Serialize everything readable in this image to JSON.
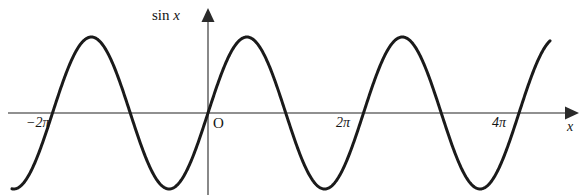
{
  "figure": {
    "background_color": "#ffffff",
    "width": 586,
    "height": 195
  },
  "labels": {
    "y_axis_label_prefix": "sin",
    "y_axis_label_variable": "x",
    "origin": "O",
    "x_axis_variable": "x",
    "tick_neg_2pi": "−2π",
    "tick_2pi": "2π",
    "tick_4pi": "4π"
  },
  "chart_data": {
    "type": "line",
    "title": "",
    "subtitle": "",
    "xlabel": "x",
    "ylabel": "sin x",
    "function": "y = sin x",
    "grid": false,
    "legend": null,
    "curve_color": "#1a1a1a",
    "curve_width_px": 3,
    "axis_color": "#6b6b6b",
    "axis_width_px": 1.5,
    "xlim_radians": [
      -7.22,
      14.05
    ],
    "ylim": [
      -1.08,
      1.08
    ],
    "period_radians": 6.283185307179586,
    "amplitude": 1,
    "x_tick_labels": [
      "−2π",
      "2π",
      "4π"
    ],
    "x_tick_values_radians": [
      -6.283185307,
      6.283185307,
      12.56637061
    ],
    "y_tick_labels": [],
    "y_tick_values": [],
    "zero_crossings_radians": [
      -6.283185307,
      -3.141592654,
      0,
      3.141592654,
      6.283185307,
      9.424777961,
      12.56637061
    ],
    "maxima_radians": [
      -4.71238898,
      1.570796327,
      7.853981634,
      14.13716694
    ],
    "minima_radians": [
      -1.570796327,
      4.71238898,
      10.99557429
    ],
    "maxima_value": 1,
    "minima_value": -1,
    "x": [
      -7.22,
      -7.0,
      -6.75,
      -6.5,
      -6.283185307,
      -6.0,
      -5.75,
      -5.5,
      -5.25,
      -5.0,
      -4.71238898,
      -4.5,
      -4.25,
      -4.0,
      -3.75,
      -3.5,
      -3.141592654,
      -2.9,
      -2.65,
      -2.4,
      -2.1,
      -1.8,
      -1.570796327,
      -1.3,
      -1.0,
      -0.7,
      -0.35,
      0,
      0.35,
      0.7,
      1.0,
      1.3,
      1.570796327,
      1.85,
      2.15,
      2.45,
      2.75,
      3.141592654,
      3.45,
      3.75,
      4.05,
      4.35,
      4.71238898,
      5.0,
      5.3,
      5.6,
      5.95,
      6.283185307,
      6.6,
      6.9,
      7.2,
      7.5,
      7.853981634,
      8.15,
      8.45,
      8.75,
      9.1,
      9.424777961,
      9.75,
      10.05,
      10.35,
      10.65,
      10.99557429,
      11.3,
      11.6,
      11.9,
      12.25,
      12.56637061,
      12.9,
      13.2,
      13.5,
      13.8,
      14.05
    ],
    "y": [
      -0.802,
      -0.657,
      -0.492,
      -0.216,
      0,
      0.279,
      0.513,
      0.706,
      0.845,
      0.959,
      1.0,
      0.978,
      0.895,
      0.757,
      0.572,
      0.351,
      0,
      -0.239,
      -0.472,
      -0.675,
      -0.863,
      -0.974,
      -1.0,
      -0.964,
      -0.841,
      -0.644,
      -0.343,
      0,
      0.343,
      0.644,
      0.841,
      0.964,
      1.0,
      0.961,
      0.834,
      0.638,
      0.382,
      0,
      -0.304,
      -0.572,
      -0.789,
      -0.932,
      -1.0,
      -0.959,
      -0.832,
      -0.631,
      -0.332,
      0,
      0.312,
      0.58,
      0.793,
      0.938,
      1.0,
      0.956,
      0.824,
      0.618,
      0.312,
      0,
      -0.319,
      -0.588,
      -0.8,
      -0.941,
      -1.0,
      -0.955,
      -0.821,
      -0.614,
      -0.308,
      0,
      0.328,
      0.598,
      0.808,
      0.945,
      0.994
    ]
  },
  "curve_geometry": {
    "origin_px": {
      "x": 208,
      "y": 113
    },
    "pi_px": 77.75,
    "amplitude_px": 76,
    "x_start_px": 12,
    "x_end_px": 550,
    "x_axis_start_px": 8,
    "x_axis_arrow_tip_px": 578,
    "y_axis_bottom_px": 195,
    "y_axis_arrow_tip_px": 10
  }
}
